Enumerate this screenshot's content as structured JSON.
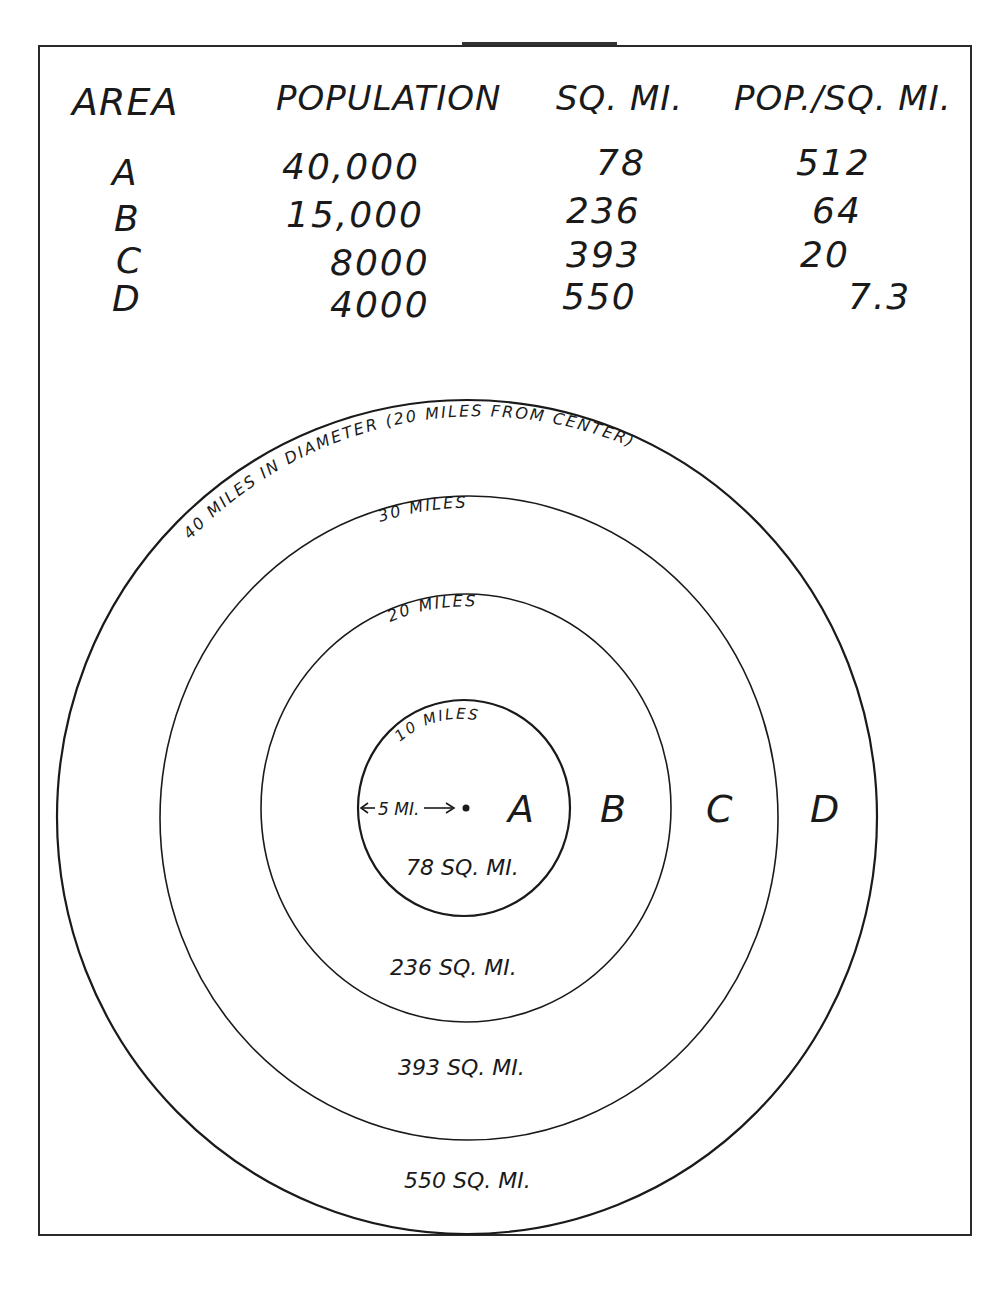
{
  "table": {
    "headers": [
      "AREA",
      "POPULATION",
      "SQ. MI.",
      "POP./SQ. MI."
    ],
    "rows": [
      {
        "area": "A",
        "population": "40,000",
        "sq_mi": "78",
        "pop_per_sq_mi": "512"
      },
      {
        "area": "B",
        "population": "15,000",
        "sq_mi": "236",
        "pop_per_sq_mi": "64"
      },
      {
        "area": "C",
        "population": "8000",
        "sq_mi": "393",
        "pop_per_sq_mi": "20"
      },
      {
        "area": "D",
        "population": "4000",
        "sq_mi": "550",
        "pop_per_sq_mi": "7.3"
      }
    ]
  },
  "diagram": {
    "outer_label": "40 MILES IN DIAMETER (20 MILES FROM CENTER)",
    "ring_labels": {
      "r30": "30 MILES",
      "r20": "20 MILES",
      "r10": "10 MILES"
    },
    "radius_label": "5 MI.",
    "zone_letters": [
      "A",
      "B",
      "C",
      "D"
    ],
    "area_labels": {
      "a": "78 SQ. MI.",
      "b": "236 SQ. MI.",
      "c": "393 SQ. MI.",
      "d": "550 SQ. MI."
    },
    "stroke_color": "#1a1a1a"
  }
}
